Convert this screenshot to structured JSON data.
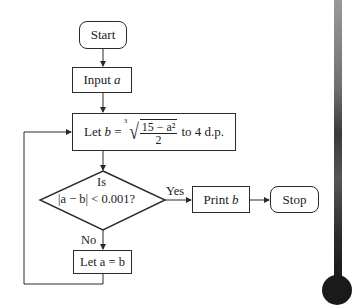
{
  "flowchart": {
    "start": {
      "label": "Start"
    },
    "input": {
      "prefix": "Input",
      "var": "a"
    },
    "compute": {
      "prefix": "Let",
      "var": "b",
      "eq": "=",
      "root_index": "3",
      "numerator": "15 − a²",
      "denominator": "2",
      "suffix": "to 4 d.p."
    },
    "decision": {
      "line1": "Is",
      "line2": "|a − b| < 0.001?"
    },
    "yes_label": "Yes",
    "no_label": "No",
    "print": {
      "prefix": "Print",
      "var": "b"
    },
    "stop": {
      "label": "Stop"
    },
    "update": {
      "text": "Let a = b"
    }
  },
  "colors": {
    "line": "#2a2a2a",
    "background": "#ffffff"
  }
}
